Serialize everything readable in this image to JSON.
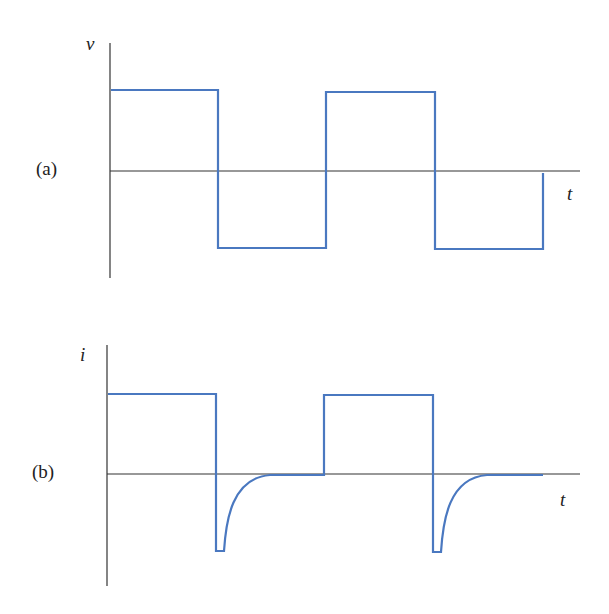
{
  "figure": {
    "panels": [
      {
        "id": "a",
        "label": "(a)",
        "y_axis_label": "v",
        "x_axis_label": "t",
        "description": "Square-wave voltage"
      },
      {
        "id": "b",
        "label": "(b)",
        "y_axis_label": "i",
        "x_axis_label": "t",
        "description": "Current: positive during high half-cycles, negative exponential spike decaying to zero at each falling edge"
      }
    ],
    "colors": {
      "waveform": "#4a78c0",
      "axes": "#333333"
    }
  }
}
